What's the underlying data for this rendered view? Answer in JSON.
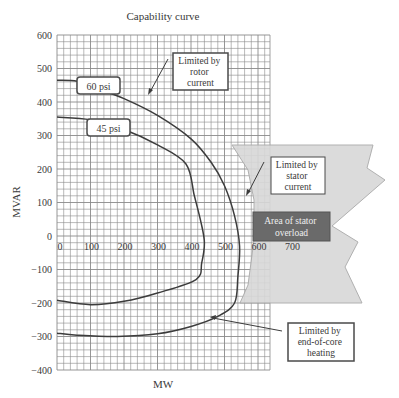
{
  "chart_data": {
    "type": "line",
    "title": "Capability curve",
    "xlabel": "MW",
    "ylabel": "MVAR",
    "xlim": [
      0,
      635
    ],
    "ylim": [
      -400,
      600
    ],
    "grid": true,
    "x_ticks": [
      "0",
      "100",
      "200",
      "300",
      "400",
      "500",
      "600",
      "700"
    ],
    "y_ticks": [
      "600",
      "500",
      "400",
      "300",
      "200",
      "100",
      "0",
      "-100",
      "-200",
      "-300",
      "-400"
    ],
    "series": [
      {
        "name": "60 psi",
        "x": [
          0,
          60,
          120,
          200,
          300,
          400,
          460,
          500,
          530,
          545,
          540,
          530,
          480,
          400,
          300,
          180,
          60,
          0
        ],
        "y": [
          465,
          462,
          440,
          410,
          360,
          290,
          220,
          150,
          60,
          -30,
          -120,
          -200,
          -240,
          -270,
          -292,
          -300,
          -296,
          -290
        ]
      },
      {
        "name": "45 psi",
        "x": [
          0,
          100,
          200,
          300,
          385,
          410,
          430,
          440,
          432,
          415,
          300,
          200,
          100,
          0
        ],
        "y": [
          355,
          347,
          318,
          272,
          215,
          120,
          40,
          -20,
          -80,
          -130,
          -170,
          -195,
          -205,
          -192
        ]
      }
    ],
    "annotations": [
      {
        "text": "60 psi"
      },
      {
        "text": "45 psi"
      },
      {
        "text": [
          "Limited by",
          "rotor",
          "current"
        ]
      },
      {
        "text": [
          "Limited by",
          "stator",
          "current"
        ]
      },
      {
        "text": [
          "Area of stator",
          "overload"
        ]
      },
      {
        "text": [
          "Limited by",
          "end-of-core",
          "heating"
        ]
      }
    ]
  },
  "labels": {
    "title": "Capability curve",
    "xlabel": "MW",
    "ylabel": "MVAR",
    "psi60": "60 psi",
    "psi45": "45 psi",
    "rotor": [
      "Limited by",
      "rotor",
      "current"
    ],
    "stator": [
      "Limited by",
      "stator",
      "current"
    ],
    "overload": [
      "Area of stator",
      "overload"
    ],
    "endcore": [
      "Limited by",
      "end-of-core",
      "heating"
    ],
    "yticks": [
      "600",
      "500",
      "400",
      "300",
      "200",
      "100",
      "0",
      "-100",
      "-200",
      "-300",
      "-400"
    ],
    "xticks": [
      "0",
      "100",
      "200",
      "300",
      "400",
      "500",
      "600",
      "700"
    ]
  },
  "colors": {
    "grid": "#8a8a8a",
    "curve": "#3c3c3c",
    "overload_fill": "#d6d6d6",
    "overload_box": "#6a6a6a"
  }
}
